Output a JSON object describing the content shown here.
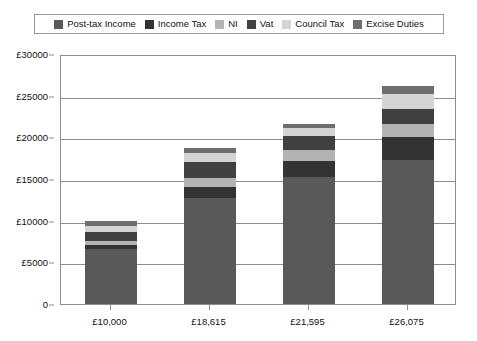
{
  "legend": {
    "position": "top",
    "items": [
      {
        "label": "Post-tax Income",
        "color": "#595959"
      },
      {
        "label": "Income Tax",
        "color": "#333333"
      },
      {
        "label": "NI",
        "color": "#b3b3b3"
      },
      {
        "label": "Vat",
        "color": "#404040"
      },
      {
        "label": "Council Tax",
        "color": "#d4d4d4"
      },
      {
        "label": "Excise Duties",
        "color": "#6e6e6e"
      }
    ]
  },
  "axes": {
    "y_ticks": [
      "0",
      "£5000",
      "£10000",
      "£15000",
      "£20000",
      "£25000",
      "£30000"
    ],
    "y_tick_values": [
      0,
      5000,
      10000,
      15000,
      20000,
      25000,
      30000
    ],
    "x_ticks": [
      "£10,000",
      "£18,615",
      "£21,595",
      "£26,075"
    ]
  },
  "chart_data": {
    "type": "bar",
    "stacked": true,
    "title": "",
    "subtitle": "",
    "xlabel": "",
    "ylabel": "",
    "ylim": [
      0,
      30000
    ],
    "grid": true,
    "legend_position": "top",
    "categories": [
      "£10,000",
      "£18,615",
      "£21,595",
      "£26,075"
    ],
    "series": [
      {
        "name": "Post-tax Income",
        "color": "#595959",
        "values": [
          6550,
          12700,
          15300,
          17300
        ]
      },
      {
        "name": "Income Tax",
        "color": "#333333",
        "values": [
          520,
          1350,
          1900,
          2800
        ]
      },
      {
        "name": "NI",
        "color": "#b3b3b3",
        "values": [
          480,
          1050,
          1250,
          1450
        ]
      },
      {
        "name": "Vat",
        "color": "#404040",
        "values": [
          1100,
          1950,
          1700,
          1900
        ]
      },
      {
        "name": "Council Tax",
        "color": "#d4d4d4",
        "values": [
          700,
          1050,
          1000,
          1700
        ]
      },
      {
        "name": "Excise Duties",
        "color": "#6e6e6e",
        "values": [
          650,
          650,
          450,
          1050
        ]
      }
    ],
    "totals": [
      10000,
      18750,
      21600,
      26200
    ]
  }
}
